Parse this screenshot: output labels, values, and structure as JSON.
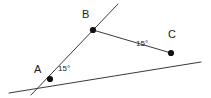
{
  "figure": {
    "type": "geometry-diagram",
    "width": 211,
    "height": 98,
    "background_color": "#ffffff",
    "line_color": "#3a3a3a",
    "vertex_color": "#111111",
    "text_color": "#1a1a1a",
    "vertices": [
      {
        "id": "A",
        "label": "A",
        "x": 50,
        "y": 79,
        "label_x": 34,
        "label_y": 64
      },
      {
        "id": "B",
        "label": "B",
        "x": 93,
        "y": 30,
        "label_x": 82,
        "label_y": 9
      },
      {
        "id": "C",
        "label": "C",
        "x": 171,
        "y": 53,
        "label_x": 168,
        "label_y": 29
      }
    ],
    "lines": [
      {
        "id": "line-through-A-and-C",
        "name": "base-line",
        "x1": 9,
        "y1": 93,
        "x2": 201,
        "y2": 62
      },
      {
        "id": "line-through-A-and-B",
        "name": "transversal-line",
        "x1": 31,
        "y1": 95,
        "x2": 118,
        "y2": 4
      }
    ],
    "segments": [
      {
        "id": "segment-BC",
        "name": "segment-b-to-c",
        "x1": 93,
        "y1": 30,
        "x2": 171,
        "y2": 53
      }
    ],
    "angles": [
      {
        "id": "angle-at-A",
        "vertex": "A",
        "value": "15°",
        "label_x": 58,
        "label_y": 65
      },
      {
        "id": "angle-at-C",
        "vertex": "C",
        "value": "15°",
        "label_x": 136,
        "label_y": 40
      }
    ]
  }
}
